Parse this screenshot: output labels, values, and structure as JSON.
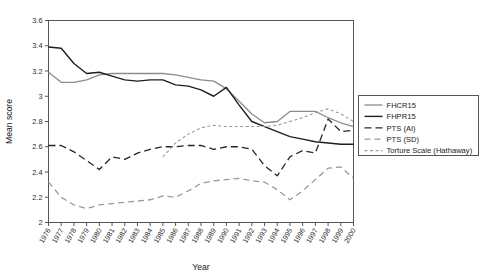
{
  "chart_data": {
    "type": "line",
    "title": "",
    "xlabel": "Year",
    "ylabel": "Mean score",
    "xlim": [
      1976,
      2000
    ],
    "ylim": [
      2,
      3.6
    ],
    "ytick_step": 0.2,
    "grid": false,
    "legend_position": "right",
    "x": [
      1976,
      1977,
      1978,
      1979,
      1980,
      1981,
      1982,
      1983,
      1984,
      1985,
      1986,
      1987,
      1988,
      1989,
      1990,
      1991,
      1992,
      1993,
      1994,
      1995,
      1996,
      1997,
      1998,
      1999,
      2000
    ],
    "categories": [
      "1976",
      "1977",
      "1978",
      "1979",
      "1980",
      "1981",
      "1982",
      "1983",
      "1984",
      "1985",
      "1986",
      "1987",
      "1988",
      "1989",
      "1990",
      "1991",
      "1992",
      "1993",
      "1994",
      "1995",
      "1996",
      "1997",
      "1998",
      "1999",
      "2000"
    ],
    "yticks": [
      "2",
      "2.2",
      "2.4",
      "2.6",
      "2.8",
      "3",
      "3.2",
      "3.4",
      "3.6"
    ],
    "series": [
      {
        "name": "FHCR15",
        "color": "#8c8c8c",
        "dash": "none",
        "width": 1.3,
        "values": [
          3.19,
          3.11,
          3.11,
          3.13,
          3.17,
          3.18,
          3.18,
          3.18,
          3.18,
          3.18,
          3.17,
          3.15,
          3.13,
          3.12,
          3.06,
          2.96,
          2.86,
          2.79,
          2.8,
          2.88,
          2.88,
          2.88,
          2.83,
          2.79,
          2.76
        ]
      },
      {
        "name": "FHPR15",
        "color": "#1f1f1f",
        "dash": "none",
        "width": 1.4,
        "values": [
          3.39,
          3.38,
          3.26,
          3.18,
          3.19,
          3.16,
          3.13,
          3.12,
          3.13,
          3.13,
          3.09,
          3.08,
          3.05,
          3.0,
          3.07,
          2.93,
          2.8,
          2.76,
          2.72,
          2.68,
          2.66,
          2.64,
          2.63,
          2.62,
          2.62
        ]
      },
      {
        "name": "PTS (AI)",
        "color": "#262626",
        "dash": "7,4",
        "width": 1.3,
        "values": [
          2.61,
          2.61,
          2.56,
          2.49,
          2.42,
          2.52,
          2.5,
          2.55,
          2.58,
          2.6,
          2.6,
          2.61,
          2.61,
          2.58,
          2.6,
          2.6,
          2.58,
          2.45,
          2.37,
          2.52,
          2.57,
          2.55,
          2.82,
          2.72,
          2.73
        ]
      },
      {
        "name": "PTS (SD)",
        "color": "#9a9a9a",
        "dash": "6,4",
        "width": 1.3,
        "values": [
          2.32,
          2.2,
          2.14,
          2.11,
          2.14,
          2.15,
          2.16,
          2.17,
          2.18,
          2.21,
          2.2,
          2.25,
          2.31,
          2.33,
          2.34,
          2.35,
          2.33,
          2.32,
          2.26,
          2.18,
          2.25,
          2.34,
          2.43,
          2.44,
          2.35
        ]
      },
      {
        "name": "Torture Scale (Hathaway)",
        "color": "#9a9a9a",
        "dash": "3,2.5",
        "width": 1.1,
        "values": [
          null,
          null,
          null,
          null,
          null,
          null,
          null,
          null,
          null,
          2.52,
          2.63,
          2.7,
          2.75,
          2.77,
          2.76,
          2.76,
          2.76,
          2.76,
          2.77,
          2.8,
          2.83,
          2.87,
          2.9,
          2.86,
          2.8
        ]
      }
    ]
  },
  "legend": {
    "items": [
      {
        "label": "FHCR15"
      },
      {
        "label": "FHPR15"
      },
      {
        "label": "PTS (AI)"
      },
      {
        "label": "PTS (SD)"
      },
      {
        "label": "Torture Scale (Hathaway)"
      }
    ]
  }
}
